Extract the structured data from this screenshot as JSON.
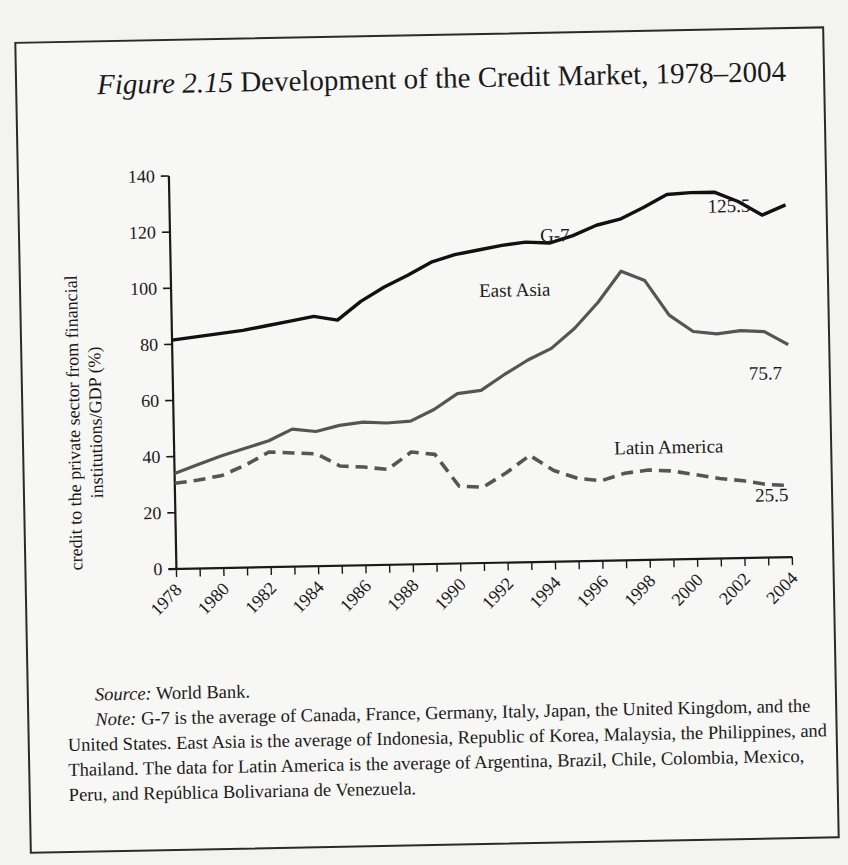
{
  "figure": {
    "number": "Figure 2.15",
    "title": "Development of the Credit Market, 1978–2004"
  },
  "notes": {
    "source_label": "Source:",
    "source_text": "World Bank.",
    "note_label": "Note:",
    "note_text": "G-7 is the average of Canada, France, Germany, Italy, Japan, the United Kingdom, and the United States. East Asia is the average of Indonesia, Republic of Korea, Malaysia, the Philippines, and Thailand. The data for Latin America is the average of Argentina, Brazil, Chile, Colombia, Mexico, Peru, and República Bolivariana de Venezuela."
  },
  "chart_data": {
    "type": "line",
    "title": "Development of the Credit Market, 1978–2004",
    "xlabel": "",
    "ylabel": "credit to the private sector from financial institutions/GDP (%)",
    "ylim": [
      0,
      140
    ],
    "yticks": [
      0,
      20,
      40,
      60,
      80,
      100,
      120,
      140
    ],
    "xticks": [
      "1978",
      "1980",
      "1982",
      "1984",
      "1986",
      "1988",
      "1990",
      "1992",
      "1994",
      "1996",
      "1998",
      "2000",
      "2002",
      "2004"
    ],
    "grid": false,
    "legend": "inline labels",
    "x": [
      1978,
      1979,
      1980,
      1981,
      1982,
      1983,
      1984,
      1985,
      1986,
      1987,
      1988,
      1989,
      1990,
      1991,
      1992,
      1993,
      1994,
      1995,
      1996,
      1997,
      1998,
      1999,
      2000,
      2001,
      2002,
      2003,
      2004
    ],
    "series": [
      {
        "name": "G-7",
        "style": "solid-black",
        "values": [
          81.5,
          82.5,
          83.5,
          84.5,
          86,
          87.5,
          89,
          87.5,
          94,
          99,
          103,
          107.5,
          110,
          111.5,
          113,
          114,
          113.5,
          116,
          119.5,
          121.5,
          125.5,
          130,
          130.5,
          130.5,
          127,
          122,
          125.5
        ],
        "end_label": "125.5"
      },
      {
        "name": "East Asia",
        "style": "solid-gray",
        "values": [
          34,
          37,
          40,
          42.5,
          45,
          49,
          48,
          50,
          51,
          50.5,
          51,
          55,
          60.5,
          61.5,
          67,
          72,
          76,
          83,
          92,
          103,
          99.5,
          87,
          81,
          80,
          81,
          80.5,
          75.7
        ],
        "end_label": "75.7"
      },
      {
        "name": "Latin America",
        "style": "dashed-gray",
        "values": [
          30.5,
          31.5,
          33,
          36.5,
          41,
          40.5,
          40,
          35.5,
          35,
          34,
          40,
          39,
          27.5,
          27,
          32,
          38,
          32.5,
          29.5,
          28.5,
          31,
          32,
          31.5,
          30,
          28.5,
          27.5,
          26,
          25.5
        ],
        "end_label": "25.5"
      }
    ]
  },
  "colors": {
    "g7": "#111111",
    "east_asia": "#555555",
    "latin_america": "#555555",
    "axis": "#1a1a1a",
    "border": "#2a2a2a"
  }
}
